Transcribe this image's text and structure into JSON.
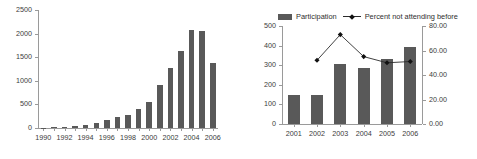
{
  "chart_data": [
    {
      "type": "bar",
      "title": "",
      "xlabel": "",
      "ylabel": "",
      "grid": false,
      "legend": "none",
      "ylim": [
        0,
        2500
      ],
      "yticks": [
        "0",
        "500",
        "1000",
        "1500",
        "2000",
        "2500"
      ],
      "categories": [
        "1990",
        "1991",
        "1992",
        "1993",
        "1994",
        "1995",
        "1996",
        "1997",
        "1998",
        "1999",
        "2000",
        "2001",
        "2002",
        "2003",
        "2004",
        "2005",
        "2006"
      ],
      "tick_labels": [
        "1990",
        "",
        "1992",
        "",
        "1994",
        "",
        "1996",
        "",
        "1998",
        "",
        "2000",
        "",
        "2002",
        "",
        "2004",
        "",
        "2006"
      ],
      "values": [
        10,
        15,
        30,
        45,
        75,
        105,
        165,
        225,
        280,
        410,
        560,
        910,
        1270,
        1630,
        2080,
        2060,
        1380
      ],
      "bar_color": "#595959"
    },
    {
      "type": "bar",
      "title": "",
      "xlabel": "",
      "ylabel": "",
      "grid": false,
      "legend": "top",
      "categories": [
        "2001",
        "2002",
        "2003",
        "2004",
        "2005",
        "2006"
      ],
      "ylim": [
        0,
        500
      ],
      "yticks": [
        "0",
        "100",
        "200",
        "300",
        "400",
        "500"
      ],
      "y2lim": [
        0,
        80
      ],
      "y2ticks": [
        "0.00",
        "20.00",
        "40.00",
        "60.00",
        "80.00"
      ],
      "series": [
        {
          "name": "Participation",
          "type": "bar",
          "axis": "left",
          "color": "#595959",
          "values": [
            148,
            150,
            305,
            288,
            330,
            392
          ]
        },
        {
          "name": "Percent not attending before",
          "type": "line",
          "axis": "right",
          "color": "#2b2b2b",
          "marker": "diamond",
          "values": [
            null,
            52.0,
            73.0,
            55.0,
            50.0,
            51.0
          ]
        }
      ]
    }
  ],
  "left_chart": {
    "name": "participation-growth-chart",
    "yticks": [
      "2500",
      "2000",
      "1500",
      "1000",
      "500",
      "0"
    ],
    "xticks": [
      "1990",
      "1992",
      "1994",
      "1996",
      "1998",
      "2000",
      "2002",
      "2004",
      "2006"
    ]
  },
  "right_chart": {
    "name": "participation-and-percent-chart",
    "legend": {
      "bar_label": "Participation",
      "line_label": "Percent not attending before"
    },
    "yticks_left": [
      "500",
      "400",
      "300",
      "200",
      "100",
      "0"
    ],
    "yticks_right": [
      "80.00",
      "60.00",
      "40.00",
      "20.00",
      "0.00"
    ],
    "xticks": [
      "2001",
      "2002",
      "2003",
      "2004",
      "2005",
      "2006"
    ]
  },
  "colors": {
    "bar": "#595959",
    "line": "#2b2b2b",
    "axis": "#9a9a9a",
    "text": "#3b3b3b",
    "background": "#ffffff"
  }
}
